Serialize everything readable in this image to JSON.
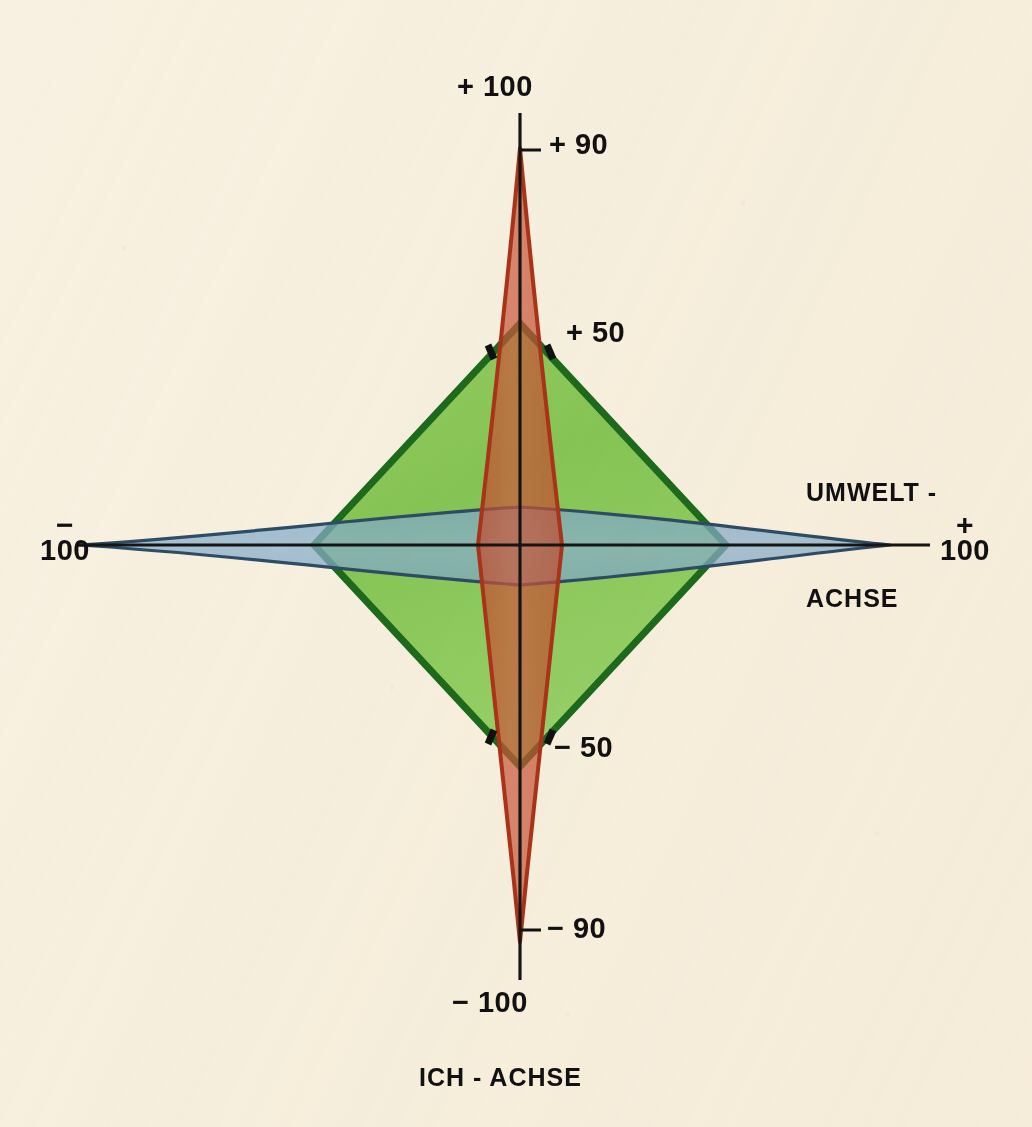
{
  "figure": {
    "background_color": "#f8f1e1",
    "width": 1032,
    "height": 1127
  },
  "labels": {
    "top_outer": "+ 100",
    "top_inner": "+ 90",
    "top_mid": "+ 50",
    "bottom_mid": "− 50",
    "bottom_inner": "− 90",
    "bottom_outer": "− 100",
    "left_sign": "−",
    "left_value": "100",
    "right_sign": "+",
    "right_value": "100",
    "x_axis_name_line1": "UMWELT -",
    "x_axis_name_line2": "ACHSE",
    "y_axis_name": "ICH - ACHSE"
  },
  "chart_data": {
    "type": "area",
    "title": "",
    "subtitle": "",
    "xlabel": "UMWELT - ACHSE",
    "ylabel": "ICH - ACHSE",
    "xlim": [
      -100,
      100
    ],
    "ylim": [
      -100,
      100
    ],
    "grid": false,
    "legend_position": "none",
    "axes": [
      {
        "name": "UMWELT - ACHSE",
        "orientation": "horizontal",
        "min_label": "−100",
        "max_label": "+100",
        "min_value": -100,
        "max_value": 100,
        "ticks": [
          -100,
          100
        ]
      },
      {
        "name": "ICH - ACHSE",
        "orientation": "vertical",
        "min_label": "−100",
        "max_label": "+100",
        "min_value": -100,
        "max_value": 100,
        "ticks": [
          -100,
          -90,
          -50,
          50,
          90,
          100
        ]
      }
    ],
    "series": [
      {
        "name": "red-lens",
        "color": "#c1492c",
        "fill_color": "#c8543a",
        "stroke_color": "#a5321c",
        "opacity": 0.78,
        "shape": "vertical-lens",
        "description": "Narrow vertical lens along the ICH axis, reaching +90 and -90, widest at the origin with half-width about 17 on the UMWELT axis.",
        "extent_ich": [
          -90,
          90
        ],
        "extent_umwelt": [
          -17,
          17
        ],
        "vertices": [
          {
            "umwelt": 0,
            "ich": 90
          },
          {
            "umwelt": 17,
            "ich": 0
          },
          {
            "umwelt": 0,
            "ich": -90
          },
          {
            "umwelt": -17,
            "ich": 0
          }
        ]
      },
      {
        "name": "green-diamond",
        "color": "#4f9c38",
        "fill_color": "#7cc24a",
        "stroke_color": "#1d6b1d",
        "opacity": 0.8,
        "shape": "diamond",
        "description": "Large green rhombus reaching +50 and -50 on the ICH axis and about -50 / +50 on the UMWELT axis.",
        "extent_ich": [
          -50,
          50
        ],
        "extent_umwelt": [
          -50,
          50
        ],
        "vertices": [
          {
            "umwelt": 0,
            "ich": 50
          },
          {
            "umwelt": 50,
            "ich": 0
          },
          {
            "umwelt": 0,
            "ich": -50
          },
          {
            "umwelt": -50,
            "ich": 0
          }
        ]
      },
      {
        "name": "blue-lens",
        "color": "#6d9cc0",
        "fill_color": "#86accc",
        "stroke_color": "#2d4a63",
        "opacity": 0.78,
        "shape": "horizontal-lens",
        "description": "Wide flat horizontal lens along the UMWELT axis reaching -100 and +100, widest at the origin with half-height about 9 on the ICH axis.",
        "extent_umwelt": [
          -100,
          100
        ],
        "extent_ich": [
          -9,
          9
        ],
        "vertices": [
          {
            "umwelt": -100,
            "ich": 0
          },
          {
            "umwelt": 0,
            "ich": 9
          },
          {
            "umwelt": 100,
            "ich": 0
          },
          {
            "umwelt": 0,
            "ich": -9
          }
        ]
      }
    ],
    "annotations": [
      {
        "text": "+ 100",
        "axis": "ich",
        "value": 100
      },
      {
        "text": "+ 90",
        "axis": "ich",
        "value": 90
      },
      {
        "text": "+ 50",
        "axis": "ich",
        "value": 50
      },
      {
        "text": "− 50",
        "axis": "ich",
        "value": -50
      },
      {
        "text": "− 90",
        "axis": "ich",
        "value": -90
      },
      {
        "text": "− 100",
        "axis": "ich",
        "value": -100
      },
      {
        "text": "−100",
        "axis": "umwelt",
        "value": -100
      },
      {
        "text": "+100",
        "axis": "umwelt",
        "value": 100
      }
    ]
  }
}
